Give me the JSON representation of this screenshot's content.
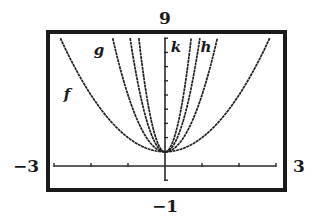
{
  "chart_data": {
    "type": "line",
    "title": "",
    "xlabel": "",
    "ylabel": "",
    "xlim": [
      -3,
      3
    ],
    "ylim": [
      -1,
      9
    ],
    "xscl": 1,
    "yscl": 1,
    "grid": false,
    "window_labels": {
      "ymax": "9",
      "ymin": "−1",
      "xmin": "−3",
      "xmax": "3"
    },
    "series": [
      {
        "name": "f",
        "label": "f",
        "equation": "y = x^2 + 1",
        "a": 1,
        "k": 1
      },
      {
        "name": "g",
        "label": "g",
        "equation": "y = 4x^2 + 1",
        "a": 4,
        "k": 1
      },
      {
        "name": "h",
        "label": "h",
        "equation": "y = 9x^2 + 1",
        "a": 9,
        "k": 1
      },
      {
        "name": "k",
        "label": "k",
        "equation": "y = 16x^2 + 1",
        "a": 16,
        "k": 1
      }
    ],
    "vertex": [
      0,
      1
    ]
  },
  "colors": {
    "frame": "#1a1a1a",
    "curve": "#1f1f1f",
    "axis": "#2a2a2a",
    "background": "#ffffff"
  }
}
